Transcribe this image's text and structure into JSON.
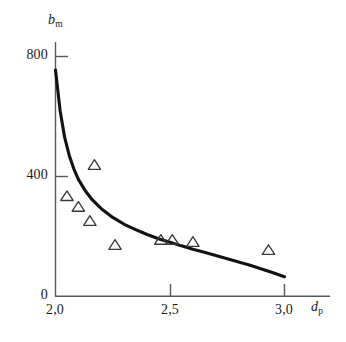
{
  "figure": {
    "background_color": "#ffffff",
    "axis_color": "#58585a",
    "curve_color": "#121212",
    "marker_color": "#3a3a3a"
  },
  "axes": {
    "y": {
      "name_base": "b",
      "name_sub": "m",
      "ticks": [
        {
          "label": "0",
          "value": 0
        },
        {
          "label": "400",
          "value": 400
        },
        {
          "label": "800",
          "value": 800
        }
      ]
    },
    "x": {
      "name_base": "d",
      "name_sub": "p",
      "ticks": [
        {
          "label": "2,0",
          "value": 2.0
        },
        {
          "label": "2,5",
          "value": 2.5
        },
        {
          "label": "3,0",
          "value": 3.0
        }
      ]
    }
  },
  "chart_data": {
    "type": "scatter",
    "title": "",
    "xlabel": "d_p",
    "ylabel": "b_m",
    "xlim": [
      2.0,
      3.05
    ],
    "ylim": [
      0,
      860
    ],
    "grid": false,
    "legend": null,
    "xticks": [
      2.0,
      2.5,
      3.0
    ],
    "xticklabels": [
      "2,0",
      "2,5",
      "3,0"
    ],
    "yticks": [
      0,
      400,
      800
    ],
    "yticklabels": [
      "0",
      "400",
      "800"
    ],
    "series": [
      {
        "name": "measured points",
        "type": "scatter",
        "marker": "triangle-up-open",
        "points": [
          {
            "x": 2.05,
            "y": 333
          },
          {
            "x": 2.1,
            "y": 297
          },
          {
            "x": 2.15,
            "y": 250
          },
          {
            "x": 2.17,
            "y": 437
          },
          {
            "x": 2.26,
            "y": 170
          },
          {
            "x": 2.46,
            "y": 187
          },
          {
            "x": 2.51,
            "y": 187
          },
          {
            "x": 2.6,
            "y": 180
          },
          {
            "x": 2.93,
            "y": 153
          }
        ]
      },
      {
        "name": "fitted curve",
        "type": "line",
        "points": [
          {
            "x": 2.0,
            "y": 755
          },
          {
            "x": 2.02,
            "y": 620
          },
          {
            "x": 2.04,
            "y": 530
          },
          {
            "x": 2.06,
            "y": 470
          },
          {
            "x": 2.08,
            "y": 425
          },
          {
            "x": 2.1,
            "y": 390
          },
          {
            "x": 2.13,
            "y": 352
          },
          {
            "x": 2.16,
            "y": 322
          },
          {
            "x": 2.2,
            "y": 292
          },
          {
            "x": 2.25,
            "y": 263
          },
          {
            "x": 2.3,
            "y": 240
          },
          {
            "x": 2.35,
            "y": 222
          },
          {
            "x": 2.4,
            "y": 206
          },
          {
            "x": 2.45,
            "y": 192
          },
          {
            "x": 2.5,
            "y": 180
          },
          {
            "x": 2.55,
            "y": 168
          },
          {
            "x": 2.6,
            "y": 157
          },
          {
            "x": 2.65,
            "y": 147
          },
          {
            "x": 2.7,
            "y": 136
          },
          {
            "x": 2.75,
            "y": 125
          },
          {
            "x": 2.8,
            "y": 114
          },
          {
            "x": 2.85,
            "y": 103
          },
          {
            "x": 2.9,
            "y": 91
          },
          {
            "x": 2.95,
            "y": 78
          },
          {
            "x": 3.0,
            "y": 65
          }
        ]
      }
    ]
  }
}
